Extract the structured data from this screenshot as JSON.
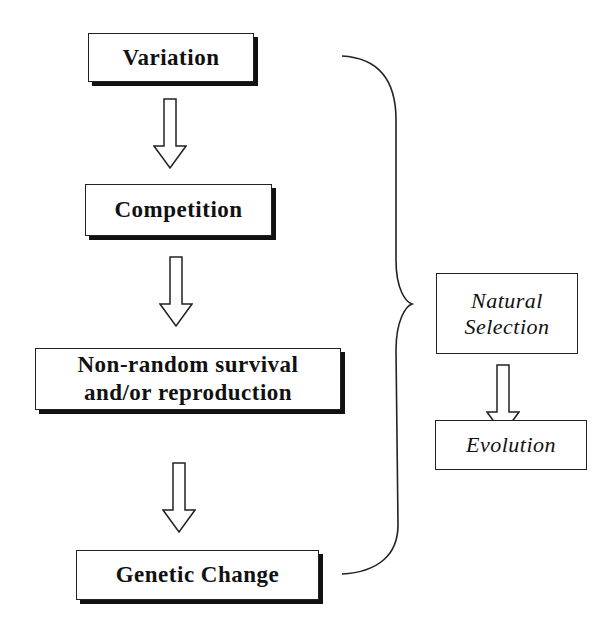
{
  "diagram": {
    "left_chain": [
      {
        "label": "Variation"
      },
      {
        "label": "Competition"
      },
      {
        "label": "Non-random survival and/or reproduction",
        "line1": "Non-random survival",
        "line2": "and/or reproduction"
      },
      {
        "label": "Genetic Change"
      }
    ],
    "right_chain": [
      {
        "label": "Natural Selection",
        "line1": "Natural",
        "line2": "Selection"
      },
      {
        "label": "Evolution"
      }
    ],
    "connectors": [
      {
        "from": "Variation",
        "to": "Competition",
        "type": "hollow-down-arrow"
      },
      {
        "from": "Competition",
        "to": "Non-random survival and/or reproduction",
        "type": "hollow-down-arrow"
      },
      {
        "from": "Non-random survival and/or reproduction",
        "to": "Genetic Change",
        "type": "hollow-down-arrow"
      },
      {
        "from": "left_chain",
        "to": "Natural Selection",
        "type": "curly-brace"
      },
      {
        "from": "Natural Selection",
        "to": "Evolution",
        "type": "hollow-down-arrow"
      }
    ]
  }
}
